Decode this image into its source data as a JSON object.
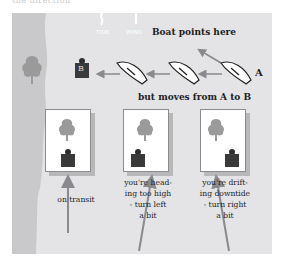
{
  "header": {
    "cutoff_text": "the direction"
  },
  "diagram": {
    "indicators": {
      "tide_label": "TIDE",
      "wind_label": "WIND"
    },
    "top_caption": "Boat points here",
    "middle_caption": "but moves from A to B",
    "point_a_label": "A",
    "point_b_label": "B",
    "panels": [
      {
        "caption_lines": [
          "on transit"
        ]
      },
      {
        "caption_lines": [
          "you're head-",
          "ing too high",
          "- turn left",
          "a bit"
        ]
      },
      {
        "caption_lines": [
          "you're drift-",
          "ing downtide",
          "- turn right",
          "a bit"
        ]
      }
    ],
    "colors": {
      "water": "#e4e4e6",
      "shore": "#c9c9cb",
      "tree": "#9a9a9a",
      "buoy": "#3a3a3a",
      "arrow": "#8a8a8e",
      "text": "#1d1d1d"
    }
  }
}
